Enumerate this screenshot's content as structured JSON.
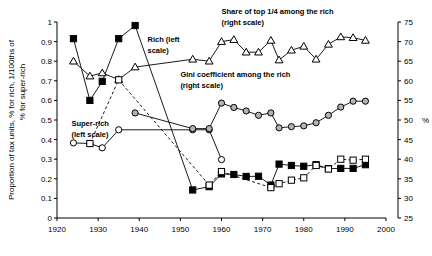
{
  "chart_data": {
    "type": "line",
    "title": "",
    "xlabel": "",
    "ylabel_left": "Proportion of tax units, % for rich, 1/100ths of % for super-rich",
    "ylabel_right": "%",
    "xlim": [
      1920,
      2000
    ],
    "ylim_left": [
      0,
      1
    ],
    "ylim_right": [
      25,
      75
    ],
    "grid": false,
    "legend_position": "inline-annotations",
    "xticks": [
      1920,
      1930,
      1940,
      1950,
      1960,
      1970,
      1980,
      1990,
      2000
    ],
    "yticks_left": [
      "0",
      "0.1",
      "0.2",
      "0.3",
      "0.4",
      "0.5",
      "0.6",
      "0.7",
      "0.8",
      "0.9",
      "1"
    ],
    "yticks_right": [
      25,
      30,
      35,
      40,
      45,
      50,
      55,
      60,
      65,
      70,
      75
    ],
    "annotations": [
      {
        "name": "rich-label",
        "text_line1": "Rich (left",
        "text_line2": "scale)",
        "x": 1942,
        "y_left": 0.9
      },
      {
        "name": "super-rich-label",
        "text_line1": "Super-rich",
        "text_line2": "(left scale)",
        "x": 1923.5,
        "y_left": 0.47
      },
      {
        "name": "share-top-quarter-label",
        "text_line1": "Share of top 1/4 among the rich",
        "text_line2": "(right scale)",
        "x": 1960,
        "y_right": 77
      },
      {
        "name": "gini-label",
        "text_line1": "Gini coefficient among the rich",
        "text_line2": "(right scale)",
        "x": 1950,
        "y_right": 61
      }
    ],
    "series": [
      {
        "name": "Rich (left scale)",
        "axis": "left",
        "marker": "filled-square",
        "line": "solid",
        "points": [
          {
            "x": 1924,
            "y": 0.915
          },
          {
            "x": 1928,
            "y": 0.6
          },
          {
            "x": 1931,
            "y": 0.697
          },
          {
            "x": 1935,
            "y": 0.915
          },
          {
            "x": 1939,
            "y": 0.982
          },
          {
            "x": 1953,
            "y": 0.143
          },
          {
            "x": 1957,
            "y": 0.16
          },
          {
            "x": 1960,
            "y": 0.225
          },
          {
            "x": 1963,
            "y": 0.222
          },
          {
            "x": 1966,
            "y": 0.212
          },
          {
            "x": 1969,
            "y": 0.213
          },
          {
            "x": 1972,
            "y": 0.168
          },
          {
            "x": 1974,
            "y": 0.275
          },
          {
            "x": 1977,
            "y": 0.268
          },
          {
            "x": 1980,
            "y": 0.264
          },
          {
            "x": 1983,
            "y": 0.272
          },
          {
            "x": 1986,
            "y": 0.252
          },
          {
            "x": 1989,
            "y": 0.253
          },
          {
            "x": 1992,
            "y": 0.253
          },
          {
            "x": 1995,
            "y": 0.272
          }
        ]
      },
      {
        "name": "Super-rich (left scale)",
        "axis": "left",
        "marker": "open-circle",
        "line": "solid",
        "points": [
          {
            "x": 1924,
            "y": 0.383
          },
          {
            "x": 1928,
            "y": 0.38
          },
          {
            "x": 1931,
            "y": 0.358
          },
          {
            "x": 1935,
            "y": 0.45
          },
          {
            "x": 1953,
            "y": 0.45
          },
          {
            "x": 1957,
            "y": 0.45
          },
          {
            "x": 1960,
            "y": 0.298
          }
        ]
      },
      {
        "name": "Share of top 1/4 among the rich (right scale)",
        "axis": "right",
        "marker": "open-triangle",
        "line": "solid",
        "points": [
          {
            "x": 1924,
            "y": 65.0
          },
          {
            "x": 1928,
            "y": 61.2
          },
          {
            "x": 1931,
            "y": 62.0
          },
          {
            "x": 1935,
            "y": 60.3
          },
          {
            "x": 1939,
            "y": 63.5
          },
          {
            "x": 1953,
            "y": 65.5
          },
          {
            "x": 1957,
            "y": 65.0
          },
          {
            "x": 1960,
            "y": 70.0
          },
          {
            "x": 1963,
            "y": 70.5
          },
          {
            "x": 1966,
            "y": 67.3
          },
          {
            "x": 1969,
            "y": 67.3
          },
          {
            "x": 1972,
            "y": 70.3
          },
          {
            "x": 1974,
            "y": 65.3
          },
          {
            "x": 1977,
            "y": 67.8
          },
          {
            "x": 1980,
            "y": 68.8
          },
          {
            "x": 1983,
            "y": 65.5
          },
          {
            "x": 1986,
            "y": 69.3
          },
          {
            "x": 1989,
            "y": 71.2
          },
          {
            "x": 1992,
            "y": 71.0
          },
          {
            "x": 1995,
            "y": 70.3
          }
        ]
      },
      {
        "name": "Gini coefficient among the rich (right scale)",
        "axis": "right",
        "marker": "open-circle-gray",
        "line": "solid",
        "points": [
          {
            "x": 1939,
            "y": 51.8
          },
          {
            "x": 1953,
            "y": 47.8
          },
          {
            "x": 1957,
            "y": 47.8
          },
          {
            "x": 1960,
            "y": 54.3
          },
          {
            "x": 1963,
            "y": 53.2
          },
          {
            "x": 1966,
            "y": 52.3
          },
          {
            "x": 1969,
            "y": 51.2
          },
          {
            "x": 1972,
            "y": 51.8
          },
          {
            "x": 1974,
            "y": 48.0
          },
          {
            "x": 1977,
            "y": 48.3
          },
          {
            "x": 1980,
            "y": 48.5
          },
          {
            "x": 1983,
            "y": 49.3
          },
          {
            "x": 1986,
            "y": 51.2
          },
          {
            "x": 1989,
            "y": 53.3
          },
          {
            "x": 1992,
            "y": 54.8
          },
          {
            "x": 1995,
            "y": 54.8
          }
        ]
      },
      {
        "name": "Dashed open-square series",
        "axis": "mixed",
        "marker": "open-square",
        "line": "dashed",
        "points": [
          {
            "x": 1928,
            "y": 0.38
          },
          {
            "x": 1935,
            "y": 0.705
          },
          {
            "x": 1957,
            "y": 0.168
          },
          {
            "x": 1960,
            "y": 0.237
          },
          {
            "x": 1972,
            "y": 0.155
          },
          {
            "x": 1974,
            "y": 0.175
          },
          {
            "x": 1977,
            "y": 0.193
          },
          {
            "x": 1980,
            "y": 0.205
          },
          {
            "x": 1983,
            "y": 0.268
          },
          {
            "x": 1986,
            "y": 0.25
          },
          {
            "x": 1989,
            "y": 0.3
          },
          {
            "x": 1992,
            "y": 0.295
          },
          {
            "x": 1995,
            "y": 0.3
          }
        ]
      }
    ],
    "colors": {
      "line": "#000000",
      "marker_fill_dark": "#000000",
      "marker_fill_open": "#ffffff",
      "gray_marker": "#999999",
      "background": "#ffffff"
    }
  }
}
